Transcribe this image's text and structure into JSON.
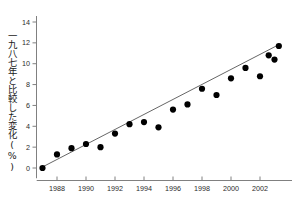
{
  "chart_data": {
    "type": "scatter",
    "title": "",
    "subtitle": "",
    "xlabel": "",
    "ylabel": "一九八七年と比較した変化(%)",
    "xlim": [
      1986.6,
      2003.6
    ],
    "ylim": [
      -0.6,
      14.4
    ],
    "xticks": [
      1988,
      1990,
      1992,
      1994,
      1996,
      1998,
      2000,
      2002
    ],
    "xtick_labels": [
      "1988",
      "1990",
      "1992",
      "1994",
      "1996",
      "1998",
      "2000",
      "2002"
    ],
    "yticks": [
      0,
      2,
      4,
      6,
      8,
      10,
      12,
      14
    ],
    "ytick_labels": [
      "0",
      "2",
      "4",
      "6",
      "8",
      "10",
      "12",
      "14"
    ],
    "grid": false,
    "legend": null,
    "legend_position": "none",
    "marker": "filled-circle",
    "marker_color": "#000000",
    "marker_size": 3.1,
    "line_color": "#555555",
    "axis_color": "#808080",
    "background": "#ffffff",
    "x": [
      1987,
      1988,
      1989,
      1990,
      1991,
      1992,
      1993,
      1994,
      1995,
      1996,
      1997,
      1998,
      1999,
      2000,
      2001,
      2002,
      2003
    ],
    "y": [
      0.0,
      1.3,
      1.9,
      2.3,
      2.0,
      3.3,
      4.2,
      4.4,
      3.9,
      5.6,
      6.1,
      7.6,
      7.0,
      8.6,
      9.6,
      8.8,
      10.4
    ],
    "values": [
      {
        "x": 1987,
        "y": 0.0
      },
      {
        "x": 1988,
        "y": 1.3
      },
      {
        "x": 1989,
        "y": 1.9
      },
      {
        "x": 1990,
        "y": 2.3
      },
      {
        "x": 1991,
        "y": 2.0
      },
      {
        "x": 1992,
        "y": 3.3
      },
      {
        "x": 1993,
        "y": 4.2
      },
      {
        "x": 1994,
        "y": 4.4
      },
      {
        "x": 1995,
        "y": 3.9
      },
      {
        "x": 1996,
        "y": 5.6
      },
      {
        "x": 1997,
        "y": 6.1
      },
      {
        "x": 1998,
        "y": 7.6
      },
      {
        "x": 1999,
        "y": 7.0
      },
      {
        "x": 2000,
        "y": 8.6
      },
      {
        "x": 2001,
        "y": 9.6
      },
      {
        "x": 2002,
        "y": 8.8
      },
      {
        "x": 2003,
        "y": 10.4
      }
    ],
    "trendline": {
      "type": "linear-fit",
      "x_start": 1987.0,
      "y_start": 0.1,
      "x_end": 2003.4,
      "y_end": 11.9
    },
    "extra_points": [
      {
        "x": 2002.6,
        "y": 10.8
      },
      {
        "x": 2003.3,
        "y": 11.7
      }
    ]
  }
}
